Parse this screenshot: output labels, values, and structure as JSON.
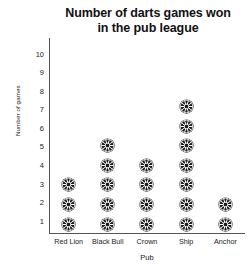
{
  "chart_data": {
    "type": "bar",
    "pictogram": true,
    "title": "Number of darts games won in the pub league",
    "title_line1": "Number of darts games won",
    "title_line2": "in the pub league",
    "xlabel": "Pub",
    "ylabel": "Number of games",
    "categories": [
      "Red Lion",
      "Black Bull",
      "Crown",
      "Ship",
      "Anchor"
    ],
    "values": [
      3,
      5,
      4,
      7,
      2
    ],
    "yticks": [
      1,
      2,
      3,
      4,
      5,
      6,
      7,
      8,
      9,
      10
    ],
    "ylim": [
      0,
      10
    ],
    "grid": false,
    "legend": "none",
    "icon": "dartboard-icon",
    "icon_unit_value": 1,
    "colors": {
      "icon": "#1c1c1c",
      "axis": "#555555",
      "text": "#222222",
      "title": "#111111",
      "background": "#ffffff"
    }
  }
}
